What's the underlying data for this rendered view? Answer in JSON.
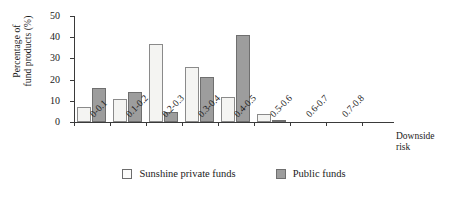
{
  "chart_data": {
    "type": "bar",
    "title": "",
    "xlabel": "Downside risk",
    "ylabel": "Percentage of fund products (%)",
    "ylabel_line1": "Percentage of",
    "ylabel_line2": "fund products (%)",
    "xlabel_line1": "Downside",
    "xlabel_line2": "risk",
    "categories": [
      "0-0.1",
      "0.1-0.2",
      "0.2-0.3",
      "0.3-0.4",
      "0.4-0.5",
      "0.5-0.6",
      "0.6-0.7",
      "0.7-0.8"
    ],
    "series": [
      {
        "name": "Sunshine private funds",
        "color": "#f4f4f2",
        "values": [
          7,
          11,
          37,
          26,
          12,
          4,
          0,
          0
        ]
      },
      {
        "name": "Public funds",
        "color": "#9d9d9d",
        "values": [
          16,
          14,
          4.5,
          21,
          41,
          1,
          0,
          0
        ]
      }
    ],
    "ylim": [
      0,
      50
    ],
    "yticks": [
      0,
      10,
      20,
      30,
      40,
      50
    ],
    "ytick_labels": [
      "0",
      "10",
      "20",
      "30",
      "40",
      "50"
    ],
    "grid": false,
    "legend_position": "bottom"
  },
  "legend": {
    "items": [
      {
        "label": "Sunshine private funds",
        "swatch": "light-swatch-icon"
      },
      {
        "label": "Public funds",
        "swatch": "dark-swatch-icon"
      }
    ]
  }
}
